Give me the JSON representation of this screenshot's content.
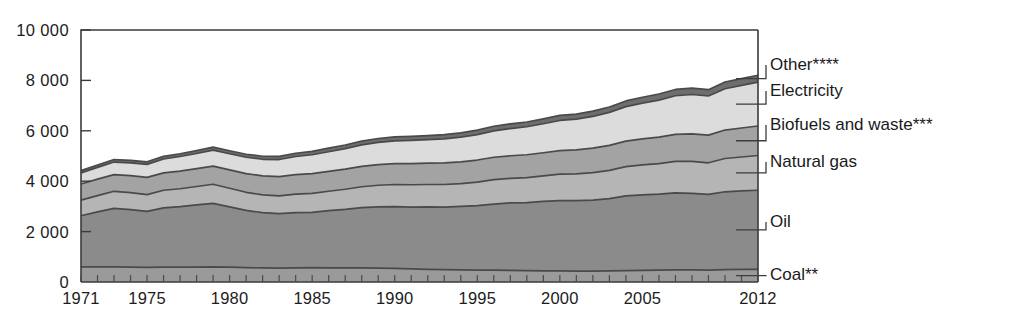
{
  "chart_data": {
    "type": "area",
    "stacked": true,
    "title": "",
    "subtitle": "",
    "xlabel": "",
    "ylabel": "",
    "grid": false,
    "legend_position": "right-inline",
    "xlim": [
      1971,
      2012
    ],
    "ylim": [
      0,
      10000
    ],
    "ytick_values": [
      0,
      2000,
      4000,
      6000,
      8000,
      10000
    ],
    "ytick_labels": [
      "0",
      "2 000",
      "4 000",
      "6 000",
      "8 000",
      "10 000"
    ],
    "xtick_values": [
      1971,
      1975,
      1980,
      1985,
      1990,
      1995,
      2000,
      2005,
      2012
    ],
    "xtick_labels": [
      "1971",
      "1975",
      "1980",
      "1985",
      "1990",
      "1995",
      "2000",
      "2005",
      "2012"
    ],
    "x": [
      1971,
      1972,
      1973,
      1974,
      1975,
      1976,
      1977,
      1978,
      1979,
      1980,
      1981,
      1982,
      1983,
      1984,
      1985,
      1986,
      1987,
      1988,
      1989,
      1990,
      1991,
      1992,
      1993,
      1994,
      1995,
      1996,
      1997,
      1998,
      1999,
      2000,
      2001,
      2002,
      2003,
      2004,
      2005,
      2006,
      2007,
      2008,
      2009,
      2010,
      2011,
      2012
    ],
    "series": [
      {
        "name": "Coal**",
        "legend_label": "Coal**",
        "color": "#9a9a9a",
        "values": [
          600,
          600,
          600,
          590,
          580,
          590,
          590,
          590,
          600,
          590,
          570,
          560,
          550,
          560,
          570,
          560,
          560,
          560,
          550,
          540,
          520,
          500,
          490,
          480,
          470,
          470,
          460,
          450,
          440,
          440,
          430,
          430,
          440,
          450,
          460,
          470,
          480,
          480,
          470,
          490,
          500,
          500
        ]
      },
      {
        "name": "Oil",
        "legend_label": "Oil",
        "color": "#8b8b8b",
        "values": [
          2030,
          2180,
          2320,
          2280,
          2220,
          2350,
          2400,
          2470,
          2520,
          2390,
          2270,
          2190,
          2160,
          2190,
          2190,
          2270,
          2320,
          2390,
          2430,
          2450,
          2450,
          2480,
          2480,
          2520,
          2560,
          2620,
          2680,
          2700,
          2760,
          2790,
          2800,
          2820,
          2870,
          2970,
          3000,
          3020,
          3060,
          3040,
          3010,
          3090,
          3120,
          3140
        ]
      },
      {
        "name": "Natural gas",
        "legend_label": "Natural gas",
        "color": "#b5b5b5",
        "values": [
          620,
          650,
          680,
          680,
          670,
          700,
          710,
          730,
          760,
          740,
          720,
          710,
          710,
          740,
          760,
          770,
          800,
          830,
          860,
          880,
          890,
          890,
          900,
          900,
          930,
          970,
          970,
          990,
          1010,
          1050,
          1060,
          1090,
          1120,
          1160,
          1190,
          1210,
          1250,
          1270,
          1250,
          1320,
          1340,
          1380
        ]
      },
      {
        "name": "Biofuels and waste***",
        "legend_label": "Biofuels and waste***",
        "color": "#a3a3a3",
        "values": [
          640,
          650,
          660,
          670,
          680,
          690,
          700,
          710,
          720,
          730,
          740,
          750,
          760,
          770,
          780,
          790,
          800,
          810,
          820,
          830,
          840,
          850,
          860,
          870,
          880,
          890,
          900,
          910,
          920,
          930,
          950,
          970,
          990,
          1010,
          1030,
          1050,
          1070,
          1090,
          1100,
          1130,
          1150,
          1170
        ]
      },
      {
        "name": "Electricity",
        "legend_label": "Electricity",
        "color": "#dcdcdc",
        "values": [
          440,
          470,
          500,
          510,
          520,
          550,
          580,
          600,
          630,
          640,
          650,
          660,
          680,
          720,
          750,
          780,
          810,
          850,
          880,
          900,
          920,
          930,
          950,
          980,
          1010,
          1050,
          1080,
          1110,
          1150,
          1200,
          1220,
          1260,
          1310,
          1370,
          1420,
          1470,
          1530,
          1560,
          1550,
          1640,
          1690,
          1740
        ]
      },
      {
        "name": "Other****",
        "legend_label": "Other****",
        "color": "#6e6e6e",
        "values": [
          90,
          95,
          100,
          100,
          100,
          105,
          110,
          115,
          120,
          120,
          120,
          120,
          125,
          130,
          135,
          140,
          145,
          150,
          155,
          160,
          160,
          160,
          165,
          170,
          175,
          180,
          185,
          190,
          195,
          200,
          205,
          210,
          215,
          225,
          230,
          240,
          250,
          255,
          250,
          265,
          270,
          275
        ]
      }
    ],
    "totals_note": "Units: Mtoe (total final consumption by source)"
  },
  "legend": {
    "entries": [
      {
        "label": "Other****"
      },
      {
        "label": "Electricity"
      },
      {
        "label": "Biofuels and waste***"
      },
      {
        "label": "Natural gas"
      },
      {
        "label": "Oil"
      },
      {
        "label": "Coal**"
      }
    ]
  },
  "colors": {
    "axis": "#3b3b3b",
    "text": "#1a1a1a",
    "background": "#ffffff"
  }
}
